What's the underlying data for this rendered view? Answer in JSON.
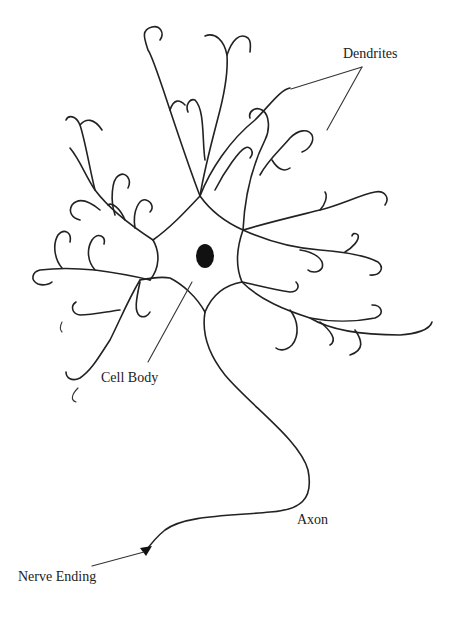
{
  "diagram": {
    "colors": {
      "background": "#ffffff",
      "ink": "#222222"
    },
    "labels": {
      "dendrites": "Dendrites",
      "cell_body": "Cell Body",
      "axon": "Axon",
      "nerve_ending": "Nerve Ending"
    }
  }
}
